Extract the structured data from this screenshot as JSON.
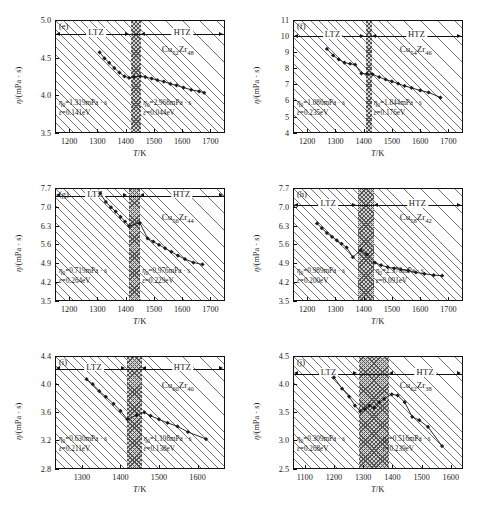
{
  "figure": {
    "axis_labels": {
      "y": "η/(mPa · s)",
      "x": "T/K"
    },
    "zone_labels": {
      "low": "LTZ",
      "high": "HTZ"
    }
  },
  "panels": [
    {
      "tag": "(e)",
      "alloy": {
        "element1": "Cu",
        "sub1": "52",
        "element2": "Zr",
        "sub2": "48"
      },
      "xlim": [
        1150,
        1750
      ],
      "ylim": [
        3.5,
        5.0
      ],
      "xticks": [
        1200,
        1300,
        1400,
        1500,
        1600,
        1700
      ],
      "yticks": [
        "5.0",
        "4.5",
        "4.0",
        "3.5"
      ],
      "ytick_values": [
        5.0,
        4.5,
        4.0,
        3.5
      ],
      "band": [
        1415,
        1452
      ],
      "zone_line_y": 4.81,
      "annotation_low": {
        "eta0": "η₀=1.319mPa · s",
        "eps": "ε=0.141eV"
      },
      "annotation_high": {
        "eta0": "η₀=2.968mPa · s",
        "eps": "ε=0.044eV"
      },
      "chart_data": {
        "type": "scatter",
        "x": [
          1308,
          1325,
          1342,
          1360,
          1378,
          1396,
          1412,
          1430,
          1452,
          1470,
          1492,
          1512,
          1535,
          1558,
          1580,
          1605,
          1632,
          1660,
          1678
        ],
        "y": [
          4.57,
          4.49,
          4.43,
          4.36,
          4.3,
          4.25,
          4.23,
          4.24,
          4.25,
          4.24,
          4.22,
          4.2,
          4.18,
          4.15,
          4.13,
          4.1,
          4.07,
          4.05,
          4.03
        ]
      }
    },
    {
      "tag": "(f)",
      "alloy": {
        "element1": "Cu",
        "sub1": "54",
        "element2": "Zr",
        "sub2": "46"
      },
      "xlim": [
        1150,
        1750
      ],
      "ylim": [
        4,
        11
      ],
      "xticks": [
        1200,
        1300,
        1400,
        1500,
        1600,
        1700
      ],
      "yticks": [
        "11",
        "10",
        "9",
        "8",
        "7",
        "6",
        "5",
        "4"
      ],
      "ytick_values": [
        11,
        10,
        9,
        8,
        7,
        6,
        5,
        4
      ],
      "band": [
        1405,
        1425
      ],
      "zone_line_y": 9.98,
      "annotation_low": {
        "eta0": "η₀=1.086mPa · s",
        "eps": "ε=0.235eV"
      },
      "annotation_high": {
        "eta0": "η₀=1.844mPa · s",
        "eps": "ε=0.176eV"
      },
      "chart_data": {
        "type": "scatter",
        "x": [
          1270,
          1292,
          1312,
          1332,
          1352,
          1370,
          1392,
          1412,
          1432,
          1455,
          1478,
          1500,
          1522,
          1545,
          1570,
          1600,
          1630,
          1672
        ],
        "y": [
          9.2,
          8.8,
          8.55,
          8.35,
          8.28,
          8.22,
          7.68,
          7.65,
          7.62,
          7.45,
          7.3,
          7.18,
          7.05,
          6.9,
          6.78,
          6.62,
          6.5,
          6.18
        ]
      }
    },
    {
      "tag": "(g)",
      "alloy": {
        "element1": "Cu",
        "sub1": "56",
        "element2": "Zr",
        "sub2": "44"
      },
      "xlim": [
        1150,
        1750
      ],
      "ylim": [
        3.5,
        7.7
      ],
      "xticks": [
        1200,
        1300,
        1400,
        1500,
        1600,
        1700
      ],
      "yticks": [
        "7.7",
        "7.0",
        "6.3",
        "5.6",
        "4.9",
        "4.2",
        "3.5"
      ],
      "ytick_values": [
        7.7,
        7.0,
        6.3,
        5.6,
        4.9,
        4.2,
        3.5
      ],
      "band": [
        1408,
        1448
      ],
      "zone_line_y": 7.42,
      "annotation_low": {
        "eta0": "η₀=0.719mPa · s",
        "eps": "ε=0.264eV"
      },
      "annotation_high": {
        "eta0": "η₀=0.976mPa · s",
        "eps": "ε=0.229eV"
      },
      "chart_data": {
        "type": "scatter",
        "x": [
          1310,
          1330,
          1348,
          1365,
          1382,
          1398,
          1412,
          1450,
          1478,
          1498,
          1518,
          1540,
          1562,
          1585,
          1610,
          1640,
          1672
        ],
        "y": [
          7.5,
          7.18,
          6.98,
          6.82,
          6.62,
          6.45,
          6.28,
          6.4,
          5.82,
          5.7,
          5.58,
          5.45,
          5.32,
          5.18,
          5.05,
          4.92,
          4.85
        ]
      }
    },
    {
      "tag": "(h)",
      "alloy": {
        "element1": "Cu",
        "sub1": "58",
        "element2": "Zr",
        "sub2": "42"
      },
      "xlim": [
        1150,
        1750
      ],
      "ylim": [
        3.5,
        7.7
      ],
      "xticks": [
        1200,
        1300,
        1400,
        1500,
        1600,
        1700
      ],
      "yticks": [
        "7.7",
        "7.0",
        "6.3",
        "5.6",
        "4.9",
        "4.2",
        "3.5"
      ],
      "ytick_values": [
        7.7,
        7.0,
        6.3,
        5.6,
        4.9,
        4.2,
        3.5
      ],
      "band": [
        1378,
        1432
      ],
      "zone_line_y": 7.05,
      "annotation_low": {
        "eta0": "η₀=0.989mPa · s",
        "eps": "ε=0.200eV"
      },
      "annotation_high": {
        "eta0": "η₀=2.376mPa · s",
        "eps": "ε=0.091eV"
      },
      "chart_data": {
        "type": "scatter",
        "x": [
          1235,
          1252,
          1270,
          1288,
          1305,
          1322,
          1340,
          1362,
          1390,
          1412,
          1440,
          1462,
          1485,
          1508,
          1532,
          1558,
          1585,
          1615,
          1648,
          1678
        ],
        "y": [
          6.38,
          6.2,
          6.02,
          5.88,
          5.75,
          5.62,
          5.48,
          5.12,
          5.38,
          5.22,
          4.92,
          4.82,
          4.75,
          4.7,
          4.66,
          4.62,
          4.55,
          4.5,
          4.45,
          4.43
        ]
      }
    },
    {
      "tag": "(i)",
      "alloy": {
        "element1": "Cu",
        "sub1": "60",
        "element2": "Zr",
        "sub2": "40"
      },
      "xlim": [
        1230,
        1670
      ],
      "ylim": [
        2.8,
        4.4
      ],
      "xticks": [
        1300,
        1400,
        1500,
        1600
      ],
      "yticks": [
        "4.4",
        "4.0",
        "3.6",
        "3.2",
        "2.8"
      ],
      "ytick_values": [
        4.4,
        4.0,
        3.6,
        3.2,
        2.8
      ],
      "band": [
        1415,
        1452
      ],
      "zone_line_y": 4.22,
      "annotation_low": {
        "eta0": "η₀=0.630mPa · s",
        "eps": "ε=0.211eV"
      },
      "annotation_high": {
        "eta0": "η₀=1.198mPa · s",
        "eps": "ε=0.138eV"
      },
      "chart_data": {
        "type": "scatter",
        "x": [
          1312,
          1328,
          1345,
          1362,
          1382,
          1400,
          1418,
          1442,
          1462,
          1478,
          1500,
          1522,
          1548,
          1575,
          1622
        ],
        "y": [
          4.07,
          4.0,
          3.9,
          3.82,
          3.72,
          3.62,
          3.5,
          3.56,
          3.6,
          3.55,
          3.5,
          3.45,
          3.4,
          3.32,
          3.22
        ]
      }
    },
    {
      "tag": "(j)",
      "alloy": {
        "element1": "Cu",
        "sub1": "62",
        "element2": "Zr",
        "sub2": "38"
      },
      "xlim": [
        1060,
        1640
      ],
      "ylim": [
        2.5,
        4.5
      ],
      "xticks": [
        1100,
        1200,
        1300,
        1400,
        1500,
        1600
      ],
      "yticks": [
        "4.5",
        "4.0",
        "3.5",
        "3.0",
        "2.5"
      ],
      "ytick_values": [
        4.5,
        4.0,
        3.5,
        3.0,
        2.5
      ],
      "band": [
        1282,
        1385
      ],
      "zone_line_y": 4.18,
      "annotation_low": {
        "eta0": "η₀=0.309mPa · s",
        "eps": "ε=0.268eV"
      },
      "annotation_high": {
        "eta0": "η₀=0.516mPa · s",
        "eps": "ε=0.239eV"
      },
      "chart_data": {
        "type": "scatter",
        "x": [
          1200,
          1228,
          1252,
          1272,
          1290,
          1305,
          1322,
          1338,
          1355,
          1372,
          1398,
          1418,
          1442,
          1468,
          1492,
          1522,
          1570
        ],
        "y": [
          4.12,
          3.92,
          3.78,
          3.62,
          3.52,
          3.56,
          3.62,
          3.58,
          3.68,
          3.74,
          3.82,
          3.8,
          3.68,
          3.42,
          3.36,
          3.24,
          2.9
        ]
      }
    }
  ]
}
